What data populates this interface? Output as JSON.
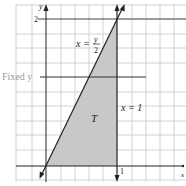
{
  "figure": {
    "y_axis_label": "y",
    "x_axis_label": "x",
    "y_tick": "2",
    "x_tick": "1",
    "fixed_line_label": "Fixed y",
    "curve_label_lhs": "x =",
    "curve_label_num": "y",
    "curve_label_den": "2",
    "vertical_line_label": "x = 1",
    "region_label": "T",
    "colors": {
      "grid": "#cfcfcf",
      "axis": "#222222",
      "region_fill": "#c8c8c8",
      "label_gray": "#9a9a9a"
    }
  }
}
